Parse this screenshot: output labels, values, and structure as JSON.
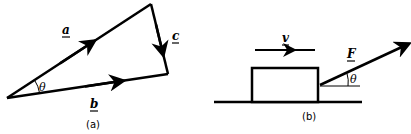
{
  "diagram_a": {
    "caption": "(a)",
    "vectors": [
      {
        "name": "a",
        "label": "a",
        "from": [
          7,
          98
        ],
        "to": [
          151,
          4
        ]
      },
      {
        "name": "c",
        "label": "c",
        "from": [
          151,
          4
        ],
        "to": [
          168,
          74
        ]
      },
      {
        "name": "b",
        "label": "b",
        "from": [
          7,
          98
        ],
        "to": [
          168,
          74
        ]
      }
    ],
    "angle_label": "θ"
  },
  "diagram_b": {
    "caption": "(b)",
    "velocity_label": "v",
    "force_label": "F",
    "angle_label": "θ"
  },
  "colors": {
    "stroke": "#000000",
    "background": "#ffffff"
  }
}
